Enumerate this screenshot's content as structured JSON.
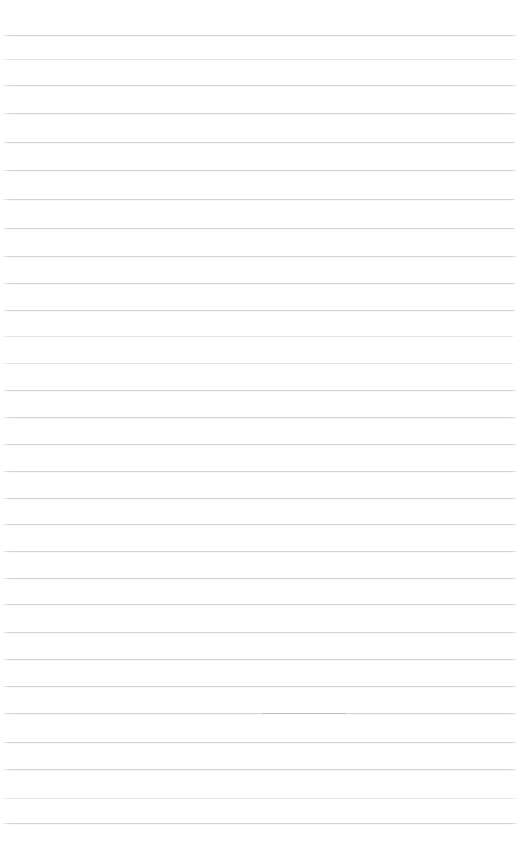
{
  "page": {
    "kind": "lined-paper",
    "width": 520,
    "height": 867,
    "background_color": "#ffffff",
    "has_visible_text": false,
    "text_content": ""
  },
  "ruling": {
    "line_color": "#d2d4d7",
    "faint_line_color": "#e2e4e6",
    "extra_faint_line_color": "#ebedee",
    "line_thickness": 1,
    "line_spacing": 27,
    "first_line_y": 35,
    "last_line_y": 823,
    "line_count": 30,
    "left_inset": 2,
    "right_inset": 5,
    "lines": [
      {
        "y": 35,
        "x": 2,
        "width": 514,
        "weight": "normal"
      },
      {
        "y": 59,
        "x": 3,
        "width": 513,
        "weight": "faint"
      },
      {
        "y": 85,
        "x": 2,
        "width": 514,
        "weight": "normal"
      },
      {
        "y": 113,
        "x": 2,
        "width": 514,
        "weight": "normal"
      },
      {
        "y": 142,
        "x": 3,
        "width": 512,
        "weight": "normal"
      },
      {
        "y": 170,
        "x": 2,
        "width": 514,
        "weight": "normal"
      },
      {
        "y": 199,
        "x": 2,
        "width": 513,
        "weight": "normal"
      },
      {
        "y": 228,
        "x": 3,
        "width": 512,
        "weight": "normal"
      },
      {
        "y": 256,
        "x": 2,
        "width": 514,
        "weight": "normal"
      },
      {
        "y": 283,
        "x": 2,
        "width": 513,
        "weight": "normal"
      },
      {
        "y": 310,
        "x": 3,
        "width": 512,
        "weight": "normal"
      },
      {
        "y": 336,
        "x": 2,
        "width": 511,
        "weight": "faint"
      },
      {
        "y": 363,
        "x": 2,
        "width": 511,
        "weight": "faint"
      },
      {
        "y": 390,
        "x": 3,
        "width": 513,
        "weight": "normal"
      },
      {
        "y": 417,
        "x": 2,
        "width": 514,
        "weight": "normal"
      },
      {
        "y": 444,
        "x": 2,
        "width": 514,
        "weight": "normal"
      },
      {
        "y": 471,
        "x": 3,
        "width": 513,
        "weight": "normal"
      },
      {
        "y": 498,
        "x": 2,
        "width": 514,
        "weight": "normal"
      },
      {
        "y": 524,
        "x": 2,
        "width": 514,
        "weight": "normal"
      },
      {
        "y": 551,
        "x": 3,
        "width": 513,
        "weight": "normal"
      },
      {
        "y": 578,
        "x": 2,
        "width": 514,
        "weight": "normal"
      },
      {
        "y": 604,
        "x": 2,
        "width": 514,
        "weight": "normal"
      },
      {
        "y": 632,
        "x": 3,
        "width": 513,
        "weight": "normal"
      },
      {
        "y": 659,
        "x": 2,
        "width": 514,
        "weight": "normal"
      },
      {
        "y": 686,
        "x": 2,
        "width": 514,
        "weight": "normal"
      },
      {
        "y": 713,
        "x": 3,
        "width": 513,
        "weight": "normal"
      },
      {
        "y": 742,
        "x": 2,
        "width": 514,
        "weight": "normal"
      },
      {
        "y": 769,
        "x": 2,
        "width": 514,
        "weight": "normal"
      },
      {
        "y": 798,
        "x": 3,
        "width": 513,
        "weight": "faint"
      },
      {
        "y": 823,
        "x": 2,
        "width": 516,
        "weight": "normal"
      }
    ],
    "overdraw_marks": [
      {
        "y": 713,
        "x": 262,
        "width": 84,
        "color": "#b9bcc0"
      }
    ]
  }
}
